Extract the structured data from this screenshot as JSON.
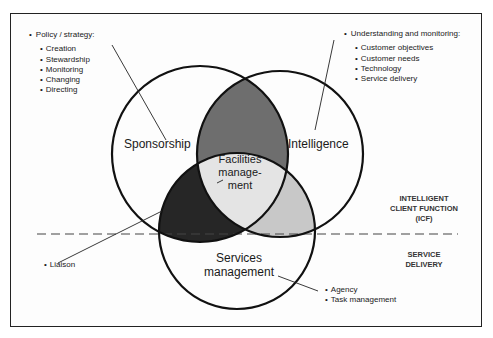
{
  "diagram": {
    "circles": [
      {
        "id": "sponsorship",
        "label": "Sponsorship",
        "cx": 200,
        "cy": 154,
        "r": 88
      },
      {
        "id": "intelligence",
        "label": "Intelligence",
        "cx": 280,
        "cy": 154,
        "r": 83
      },
      {
        "id": "services",
        "label_line1": "Services",
        "label_line2": "management",
        "cx": 237,
        "cy": 231,
        "r": 78
      }
    ],
    "center": {
      "line1": "Facilities",
      "line2": "manage-",
      "line3": "ment"
    },
    "overlap_colors": {
      "sponsorship_intelligence": "#6e6e6e",
      "sponsorship_services": "#262626",
      "intelligence_services": "#c8c8c8",
      "center": "#e4e4e4"
    },
    "policy": {
      "head": "Policy / strategy:",
      "items": [
        "Creation",
        "Stewardship",
        "Monitoring",
        "Changing",
        "Directing"
      ]
    },
    "understanding": {
      "head": "Understanding and monitoring:",
      "items": [
        "Customer objectives",
        "Customer needs",
        "Technology",
        "Service delivery"
      ]
    },
    "liaison": {
      "items": [
        "Liaison"
      ]
    },
    "agency": {
      "items": [
        "Agency",
        "Task management"
      ]
    },
    "zones": {
      "icf_line1": "INTELLIGENT",
      "icf_line2": "CLIENT FUNCTION",
      "icf_line3": "(ICF)",
      "sd_line1": "SERVICE",
      "sd_line2": "DELIVERY"
    }
  }
}
